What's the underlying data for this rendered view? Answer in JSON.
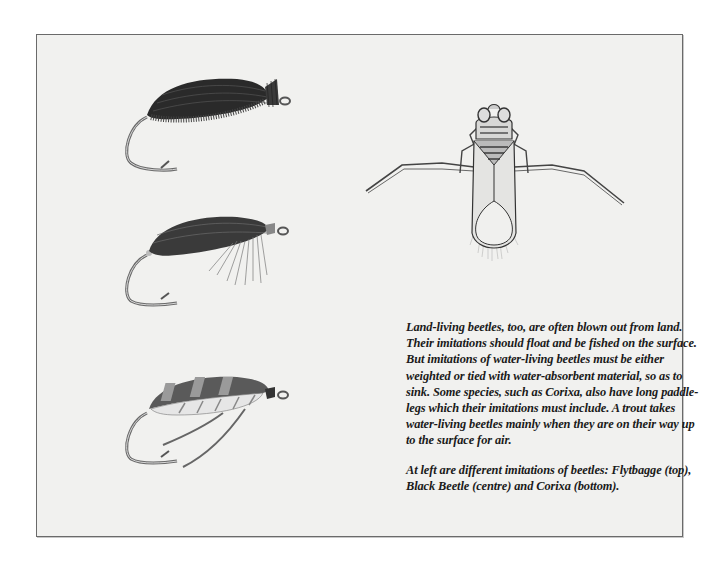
{
  "document": {
    "body_paragraph": "Land-living beetles, too, are often blown out from land. Their imitations should float and be fished on the surface. But imitations of water-living beetles must be either weighted or tied with water-absorbent material, so as to sink. Some species, such as  Corixa, also have long paddle-legs which their imitations must include. A trout takes water-living beetles mainly when they are on their way up to the surface for air.",
    "caption_paragraph": "At left are different imitations of beetles: Flytbagge  (top), Black Beetle  (centre)  and Corixa  (bottom)."
  },
  "illustrations": {
    "flies": [
      {
        "name": "Flytbagge",
        "position": "top"
      },
      {
        "name": "Black Beetle",
        "position": "centre"
      },
      {
        "name": "Corixa",
        "position": "bottom"
      }
    ],
    "insect": {
      "name": "water beetle (Corixa)"
    }
  },
  "colors": {
    "page_bg": "#f1f1ef",
    "border": "#6a6a6a",
    "text": "#1a1a1a"
  }
}
